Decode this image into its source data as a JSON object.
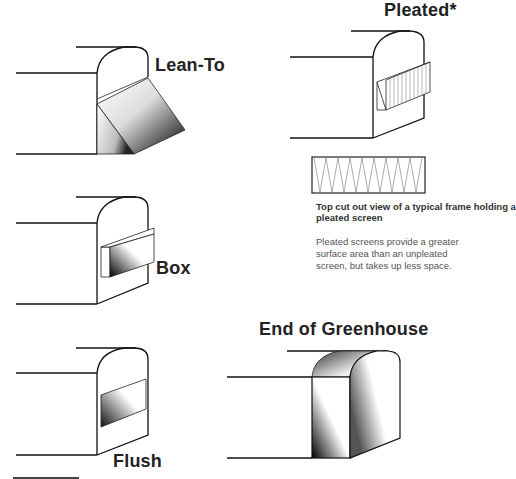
{
  "diagram": {
    "labels": {
      "lean_to": "Lean-To",
      "pleated": "Pleated*",
      "box": "Box",
      "flush": "Flush",
      "end_of_greenhouse": "End of Greenhouse"
    },
    "pleated_detail": {
      "caption_title": "Top cut out view of a typical frame holding a pleated screen",
      "caption_body": "Pleated screens provide a greater surface area than an unpleated screen, but takes up less space."
    },
    "colors": {
      "line": "#111111",
      "text": "#222222",
      "caption_text": "#555555",
      "shade_dark": "#000000",
      "shade_light": "#ffffff"
    }
  }
}
